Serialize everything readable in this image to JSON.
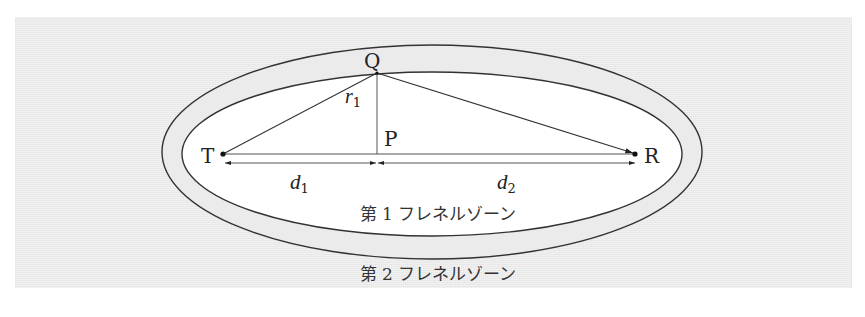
{
  "diagram": {
    "points": {
      "T": {
        "label": "T",
        "x": 223,
        "y": 154
      },
      "R": {
        "label": "R",
        "x": 635,
        "y": 154
      },
      "Q": {
        "label": "Q",
        "x": 377,
        "y": 73
      },
      "P": {
        "label": "P",
        "x": 377,
        "y": 154
      }
    },
    "labels": {
      "r1": {
        "base": "r",
        "sub": "1"
      },
      "d1": {
        "base": "d",
        "sub": "1"
      },
      "d2": {
        "base": "d",
        "sub": "2"
      },
      "zone1": "第 1 フレネルゾーン",
      "zone2": "第 2 フレネルゾーン"
    },
    "ellipses": {
      "outer": {
        "cx": 432,
        "cy": 152,
        "rx": 270,
        "ry": 107,
        "fill": "#ebebeb"
      },
      "inner": {
        "cx": 432,
        "cy": 154,
        "rx": 250,
        "ry": 82,
        "fill": "#ffffff"
      }
    },
    "colors": {
      "background": "#ebebeb",
      "stroke": "#333333",
      "zone_fill": "#ffffff"
    }
  }
}
